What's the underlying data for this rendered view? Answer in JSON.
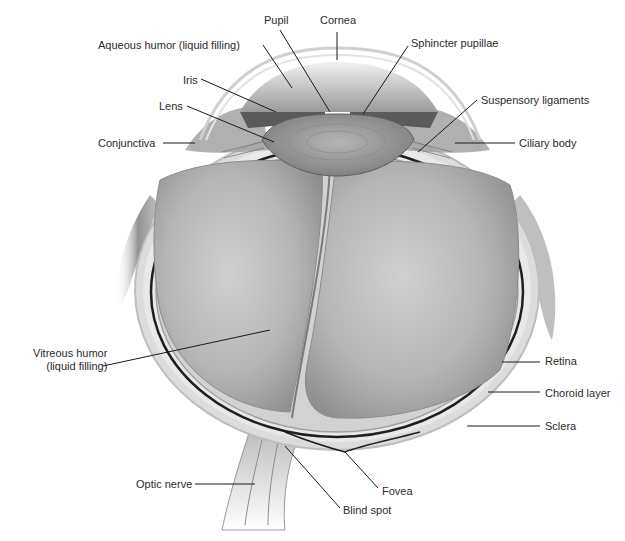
{
  "diagram": {
    "labels": [
      {
        "id": "pupil",
        "text": "Pupil",
        "x": 264,
        "y": 14,
        "anchor": "left",
        "line": [
          [
            280,
            30
          ],
          [
            330,
            112
          ]
        ]
      },
      {
        "id": "cornea",
        "text": "Cornea",
        "x": 320,
        "y": 14,
        "anchor": "left",
        "line": [
          [
            337,
            32
          ],
          [
            337,
            60
          ]
        ]
      },
      {
        "id": "aqueous-humor",
        "text": "Aqueous humor (liquid filling)",
        "x": 98,
        "y": 39,
        "anchor": "left",
        "line": [
          [
            263,
            45
          ],
          [
            292,
            88
          ]
        ]
      },
      {
        "id": "sphincter-pupillae",
        "text": "Sphincter pupillae",
        "x": 411,
        "y": 37,
        "anchor": "left",
        "line": [
          [
            408,
            46
          ],
          [
            363,
            114
          ]
        ]
      },
      {
        "id": "iris",
        "text": "Iris",
        "x": 183,
        "y": 74,
        "anchor": "left",
        "line": [
          [
            201,
            79
          ],
          [
            276,
            112
          ]
        ]
      },
      {
        "id": "lens",
        "text": "Lens",
        "x": 159,
        "y": 100,
        "anchor": "left",
        "line": [
          [
            187,
            106
          ],
          [
            274,
            142
          ]
        ]
      },
      {
        "id": "suspensory-ligaments",
        "text": "Suspensory ligaments",
        "x": 481,
        "y": 94,
        "anchor": "left",
        "line": [
          [
            477,
            100
          ],
          [
            418,
            152
          ]
        ]
      },
      {
        "id": "conjunctiva",
        "text": "Conjunctiva",
        "x": 98,
        "y": 137,
        "anchor": "left",
        "line": [
          [
            163,
            143
          ],
          [
            195,
            143
          ]
        ]
      },
      {
        "id": "ciliary-body",
        "text": "Ciliary body",
        "x": 519,
        "y": 137,
        "anchor": "left",
        "line": [
          [
            515,
            143
          ],
          [
            455,
            143
          ]
        ]
      },
      {
        "id": "vitreous-humor",
        "text": "Vitreous humor\n(liquid filling)",
        "x": 33,
        "y": 347,
        "anchor": "right",
        "line": [
          [
            103,
            366
          ],
          [
            270,
            330
          ]
        ]
      },
      {
        "id": "retina",
        "text": "Retina",
        "x": 545,
        "y": 355,
        "anchor": "left",
        "line": [
          [
            540,
            362
          ],
          [
            502,
            362
          ]
        ]
      },
      {
        "id": "choroid-layer",
        "text": "Choroid layer",
        "x": 545,
        "y": 387,
        "anchor": "left",
        "line": [
          [
            540,
            392
          ],
          [
            488,
            392
          ]
        ]
      },
      {
        "id": "sclera",
        "text": "Sclera",
        "x": 545,
        "y": 420,
        "anchor": "left",
        "line": [
          [
            540,
            426
          ],
          [
            467,
            426
          ]
        ]
      },
      {
        "id": "optic-nerve",
        "text": "Optic nerve",
        "x": 136,
        "y": 478,
        "anchor": "left",
        "line": [
          [
            195,
            484
          ],
          [
            255,
            484
          ]
        ]
      },
      {
        "id": "fovea",
        "text": "Fovea",
        "x": 382,
        "y": 485,
        "anchor": "left",
        "line": [
          [
            378,
            488
          ],
          [
            345,
            452
          ]
        ]
      },
      {
        "id": "blind-spot",
        "text": "Blind spot",
        "x": 343,
        "y": 504,
        "anchor": "left",
        "line": [
          [
            340,
            508
          ],
          [
            285,
            446
          ]
        ]
      }
    ]
  },
  "colors": {
    "background": "#ffffff",
    "label_text": "#2b2b2b",
    "leader_line": "#1a1a1a",
    "sclera": "#d8d8d8",
    "choroid": "#1e1e1e",
    "vitreous": "#b9b9b9",
    "lens": "#a9a9a9",
    "cornea": "#e6e6e6"
  }
}
